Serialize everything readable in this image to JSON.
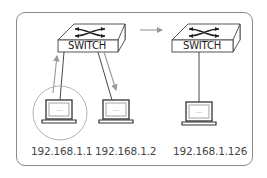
{
  "diagram": {
    "switches": [
      {
        "id": "switch-1",
        "label": "SWITCH"
      },
      {
        "id": "switch-2",
        "label": "SWITCH"
      }
    ],
    "hosts": [
      {
        "id": "host-1",
        "ip": "192.168.1.1",
        "highlighted": true,
        "screen_text": "····"
      },
      {
        "id": "host-2",
        "ip": "192.168.1.2",
        "highlighted": false,
        "screen_text": "····"
      },
      {
        "id": "host-3",
        "ip": "192.168.1.126",
        "highlighted": false,
        "screen_text": "····"
      }
    ],
    "flows": [
      {
        "from": "host-1",
        "to": "switch-1",
        "direction": "up"
      },
      {
        "from": "switch-1",
        "to": "host-2",
        "direction": "down"
      },
      {
        "from": "switch-1",
        "to": "switch-2",
        "direction": "right"
      }
    ],
    "colors": {
      "line": "#333333",
      "arrow": "#999999",
      "frame": "#8a8a8a",
      "circle": "#aaaaaa"
    }
  }
}
